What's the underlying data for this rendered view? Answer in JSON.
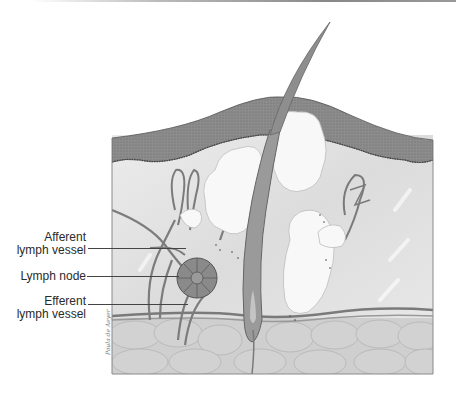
{
  "diagram": {
    "labels": [
      {
        "id": "afferent",
        "line1": "Afferent",
        "line2": "lymph vessel"
      },
      {
        "id": "node",
        "line1": "Lymph node",
        "line2": ""
      },
      {
        "id": "efferent",
        "line1": "Efferent",
        "line2": "lymph vessel"
      }
    ],
    "signature": "Paula de Aeyer"
  },
  "colors": {
    "epidermis": "#8a8a8a",
    "dermis": "#e6e6e6",
    "gland": "#f7f7f7",
    "vessel": "#7a7a7a",
    "fat": "#cfcfcf",
    "text": "#2a2a2a"
  }
}
